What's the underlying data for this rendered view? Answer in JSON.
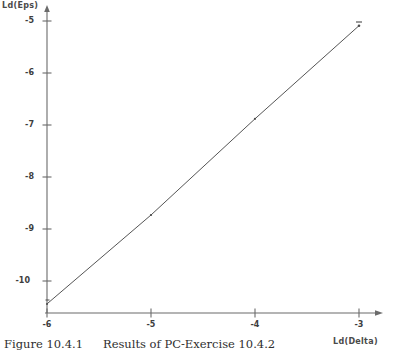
{
  "figure": {
    "caption_number": "Figure 10.4.1",
    "caption_text": "Results of PC-Exercise 10.4.2"
  },
  "chart_data": {
    "type": "line",
    "title": "",
    "xlabel": "Ld(Delta)",
    "ylabel": "Ld(Eps)",
    "xlim": [
      -6.0,
      -2.85
    ],
    "ylim": [
      -10.55,
      -4.75
    ],
    "xticks": [
      -6,
      -5,
      -4,
      -3
    ],
    "xtick_labels": [
      "-6",
      "-5",
      "-4",
      "-3"
    ],
    "yticks": [
      -5,
      -6,
      -7,
      -8,
      -9,
      -10
    ],
    "ytick_labels": [
      "-5",
      "-6",
      "-7",
      "-8",
      "-9",
      "-10"
    ],
    "grid": false,
    "legend": null,
    "series": [
      {
        "name": "Ld(Eps) vs Ld(Delta)",
        "marker": "point",
        "x": [
          -6.0,
          -5.0,
          -4.0,
          -3.0
        ],
        "y": [
          -10.44,
          -8.73,
          -6.88,
          -5.09
        ]
      }
    ],
    "annotations": [],
    "axis_arrows": true,
    "line_color": "#555555"
  }
}
